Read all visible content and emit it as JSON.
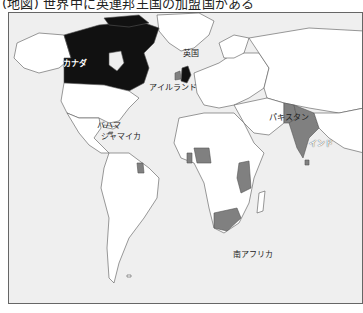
{
  "title": "(地図) 世界中に英連邦王国の加盟国がある",
  "colors": {
    "ocean": "#efefef",
    "land": "#ffffff",
    "border": "#555555",
    "realm": "#111111",
    "commonwealth": "#808080"
  },
  "legend_semantics": {
    "black": "英連邦王国",
    "gray": "英連邦加盟国"
  },
  "labels": {
    "canada": "カナダ",
    "uk": "英国",
    "ireland": "アイルランド",
    "bahamas": "バハマ",
    "jamaica": "ジャマイカ",
    "pakistan": "パキスタン",
    "india": "インド",
    "south_africa": "南アフリカ"
  }
}
